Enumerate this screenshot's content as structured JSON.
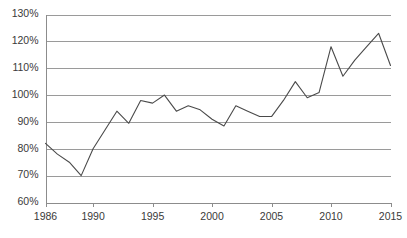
{
  "chart_data": {
    "type": "line",
    "title": "",
    "subtitle": "",
    "xlabel": "",
    "ylabel": "",
    "grid": true,
    "legend": false,
    "legend_position": "none",
    "line_color": "#4a4a4a",
    "grid_color": "#9a9a9a",
    "axis_color": "#8c8c8c",
    "background_color": "#ffffff",
    "value_suffix": "%",
    "xlim": [
      1986,
      2015
    ],
    "ylim": [
      60,
      130
    ],
    "ytick_step": 10,
    "ytick_values": [
      60,
      70,
      80,
      90,
      100,
      110,
      120,
      130
    ],
    "ytick_labels": [
      "60%",
      "70%",
      "80%",
      "90%",
      "100%",
      "110%",
      "120%",
      "130%"
    ],
    "xtick_values": [
      1986,
      1990,
      1995,
      2000,
      2005,
      2010,
      2015
    ],
    "xtick_labels": [
      "1986",
      "1990",
      "1995",
      "2000",
      "2005",
      "2010",
      "2015"
    ],
    "x": [
      1986,
      1987,
      1988,
      1989,
      1990,
      1991,
      1992,
      1993,
      1994,
      1995,
      1996,
      1997,
      1998,
      1999,
      2000,
      2001,
      2002,
      2003,
      2004,
      2005,
      2006,
      2007,
      2008,
      2009,
      2010,
      2011,
      2012,
      2013,
      2014,
      2015
    ],
    "values": [
      82,
      78,
      75,
      70,
      80,
      87,
      94,
      89.5,
      98,
      97,
      100,
      94,
      96,
      94.5,
      91,
      88.5,
      96,
      94,
      92,
      92,
      98,
      105,
      99,
      101,
      118,
      107,
      113,
      118,
      123,
      111
    ],
    "series": [
      {
        "name": "",
        "values": [
          82,
          78,
          75,
          70,
          80,
          87,
          94,
          89.5,
          98,
          97,
          100,
          94,
          96,
          94.5,
          91,
          88.5,
          96,
          94,
          92,
          92,
          98,
          105,
          99,
          101,
          118,
          107,
          113,
          118,
          123,
          111
        ]
      }
    ],
    "annotations": []
  }
}
